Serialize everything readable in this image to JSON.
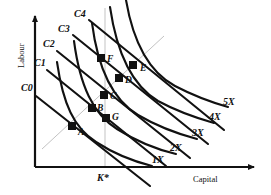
{
  "figure": {
    "background_color": "#ffffff",
    "curve_color": "#111111",
    "guide_color": "#bdbdbd",
    "axis_color": "#111111"
  },
  "axes": {
    "x_label": "Capital",
    "y_label": "Labour",
    "origin": {
      "x": 35,
      "y": 167
    },
    "x_end": {
      "x": 258,
      "y": 167
    },
    "y_end": {
      "x": 35,
      "y": 14
    }
  },
  "reference_lines": {
    "k_star": {
      "label": "K*",
      "x": 105,
      "y_top": 8,
      "y_bottom": 167,
      "label_x": 97,
      "label_y": 174
    },
    "expansion_path": {
      "x1": 42,
      "y1": 149,
      "x2": 164,
      "y2": 36
    }
  },
  "isocost_lines": [
    {
      "label": "C0",
      "label_x": 21,
      "label_y": 83,
      "x1": 36,
      "y1": 96,
      "x2": 150,
      "y2": 186
    },
    {
      "label": "C1",
      "label_x": 34,
      "label_y": 58,
      "x1": 47,
      "y1": 70,
      "x2": 166,
      "y2": 166
    },
    {
      "label": "C2",
      "label_x": 43,
      "label_y": 39,
      "x1": 57,
      "y1": 51,
      "x2": 190,
      "y2": 158
    },
    {
      "label": "C3",
      "label_x": 58,
      "label_y": 24,
      "x1": 73,
      "y1": 35,
      "x2": 208,
      "y2": 144
    },
    {
      "label": "C4",
      "label_x": 74,
      "label_y": 9,
      "x1": 89,
      "y1": 20,
      "x2": 224,
      "y2": 130
    }
  ],
  "isoquants": [
    {
      "label": "1X",
      "label_x": 152,
      "label_y": 155
    },
    {
      "label": "2X",
      "label_x": 170,
      "label_y": 143
    },
    {
      "label": "3X",
      "label_x": 192,
      "label_y": 128
    },
    {
      "label": "4X",
      "label_x": 209,
      "label_y": 112
    },
    {
      "label": "5X",
      "label_x": 223,
      "label_y": 97
    }
  ],
  "points": [
    {
      "label": "A",
      "x": 72,
      "y": 126,
      "label_x": 78,
      "label_y": 128
    },
    {
      "label": "B",
      "x": 92,
      "y": 108,
      "label_x": 97,
      "label_y": 104
    },
    {
      "label": "C",
      "x": 104,
      "y": 95,
      "label_x": 110,
      "label_y": 92
    },
    {
      "label": "D",
      "x": 119,
      "y": 78,
      "label_x": 125,
      "label_y": 76
    },
    {
      "label": "E",
      "x": 133,
      "y": 65,
      "label_x": 140,
      "label_y": 64
    },
    {
      "label": "F",
      "x": 101,
      "y": 58,
      "label_x": 107,
      "label_y": 55
    },
    {
      "label": "G",
      "x": 106,
      "y": 118,
      "label_x": 112,
      "label_y": 113
    }
  ]
}
